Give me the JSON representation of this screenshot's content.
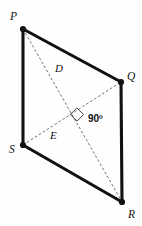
{
  "figure": {
    "kind": "quadrilateral-with-diagonals",
    "background_color": "#fefefe",
    "edge_color": "#111111",
    "diagonal_color": "#555555",
    "vertices": [
      {
        "name": "P",
        "label": "P",
        "x": 23,
        "y": 29,
        "label_x": 10,
        "label_y": 20
      },
      {
        "name": "Q",
        "label": "Q",
        "x": 121,
        "y": 82,
        "label_x": 127,
        "label_y": 80
      },
      {
        "name": "R",
        "label": "R",
        "x": 122,
        "y": 202,
        "label_x": 128,
        "label_y": 218
      },
      {
        "name": "S",
        "label": "S",
        "x": 23,
        "y": 145,
        "label_x": 9,
        "label_y": 153
      }
    ],
    "edges": [
      {
        "name": "edge-PQ",
        "from": "P",
        "to": "Q"
      },
      {
        "name": "edge-QR",
        "from": "Q",
        "to": "R"
      },
      {
        "name": "edge-RS",
        "from": "R",
        "to": "S"
      },
      {
        "name": "edge-SP",
        "from": "S",
        "to": "P"
      }
    ],
    "diagonals": [
      {
        "name": "diagonal-PR",
        "from": "P",
        "to": "R",
        "label": "D",
        "label_x": 55,
        "label_y": 72
      },
      {
        "name": "diagonal-SQ",
        "from": "S",
        "to": "Q",
        "label": "E",
        "label_x": 50,
        "label_y": 139
      }
    ],
    "intersection": {
      "name": "diagonal-intersection",
      "x": 72,
      "y": 112
    },
    "angle": {
      "label": "90º",
      "value": 90,
      "unit": "degrees",
      "label_x": 88,
      "label_y": 122,
      "mark_size": 8
    }
  }
}
